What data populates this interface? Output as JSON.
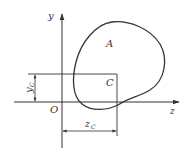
{
  "figure": {
    "labels": {
      "y_axis": "y",
      "z_axis": "z",
      "origin": "O",
      "area": "A",
      "centroid": "C",
      "yc_main": "y",
      "yc_sub": "C",
      "zc_main": "z",
      "zc_sub": "C"
    },
    "colors": {
      "stroke": "#333333",
      "background": "#ffffff"
    }
  }
}
